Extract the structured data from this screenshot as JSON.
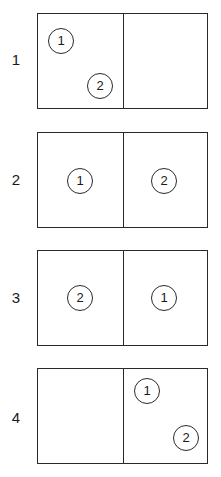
{
  "diagram": {
    "type": "numbered-layout-sequence",
    "rows": [
      {
        "label": "1",
        "markers": [
          {
            "text": "1",
            "cell": "left",
            "position": "top-left"
          },
          {
            "text": "2",
            "cell": "left",
            "position": "bottom-right"
          }
        ]
      },
      {
        "label": "2",
        "markers": [
          {
            "text": "1",
            "cell": "left",
            "position": "center"
          },
          {
            "text": "2",
            "cell": "right",
            "position": "center"
          }
        ]
      },
      {
        "label": "3",
        "markers": [
          {
            "text": "2",
            "cell": "left",
            "position": "center"
          },
          {
            "text": "1",
            "cell": "right",
            "position": "center"
          }
        ]
      },
      {
        "label": "4",
        "markers": [
          {
            "text": "1",
            "cell": "right",
            "position": "top-left"
          },
          {
            "text": "2",
            "cell": "right",
            "position": "bottom-right"
          }
        ]
      }
    ]
  }
}
